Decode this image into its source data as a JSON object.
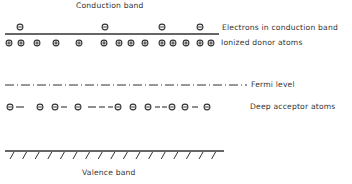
{
  "diagram": {
    "labels": {
      "conduction_band": "Conduction band",
      "electrons": "Electrons in conduction band",
      "donors": "Ionized donor atoms",
      "fermi_level": "Fermi level",
      "acceptors": "Deep acceptor atoms",
      "valence_band": "Valence band"
    },
    "symbols": {
      "electron": "minus-in-circle",
      "ionized_donor": "plus-in-circle",
      "deep_acceptor": "minus-in-circle"
    },
    "electron_x": [
      20,
      105,
      162,
      200
    ],
    "donor_x": [
      9,
      21,
      37,
      56,
      79,
      104,
      119,
      131,
      145,
      162,
      173,
      186,
      200,
      211
    ],
    "acceptor_x": [
      10,
      40,
      55,
      78,
      118,
      133,
      148,
      172,
      185,
      207
    ],
    "acceptor_dashes": [
      [
        16,
        24
      ],
      [
        61,
        67
      ],
      [
        88,
        96
      ],
      [
        99,
        105
      ],
      [
        108,
        113
      ],
      [
        155,
        160
      ],
      [
        162,
        167
      ],
      [
        192,
        198
      ]
    ],
    "levels": {
      "conduction_band_y": 34,
      "electron_y": 27,
      "donor_y": 43,
      "fermi_level_y": 85,
      "acceptor_y": 107,
      "valence_band_y": 151
    },
    "colors": {
      "ink": "#333333",
      "background": "#ffffff"
    }
  }
}
